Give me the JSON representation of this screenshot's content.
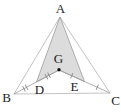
{
  "figure": {
    "point_labels": {
      "A": "A",
      "B": "B",
      "C": "C",
      "D": "D",
      "E": "E",
      "G": "G"
    },
    "shaded_region": "A-D-G-E",
    "dot_point": "G",
    "congruence_marks": [
      {
        "segment": "BD",
        "ticks": "double"
      },
      {
        "segment": "DG",
        "ticks": "double"
      },
      {
        "segment": "GE",
        "ticks": "single"
      },
      {
        "segment": "EC",
        "ticks": "single"
      }
    ],
    "colors": {
      "background": "#ffffff",
      "shaded_fill": "#dcdcdc",
      "outline": "#b4b4b4",
      "inner_lines": "#9c9c9c",
      "tick": "#8a8a8a",
      "dot": "#111111",
      "label": "#222222"
    }
  }
}
